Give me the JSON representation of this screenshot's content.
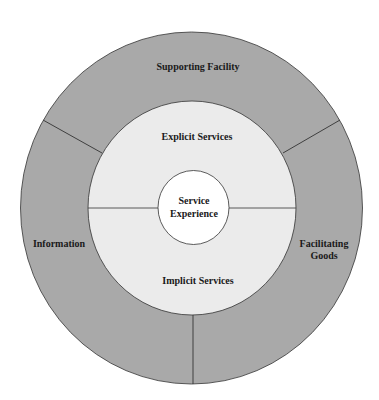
{
  "diagram": {
    "title": "",
    "outer_ring": {
      "segments": [
        {
          "id": "supporting-facility",
          "lines": [
            "Supporting Facility"
          ]
        },
        {
          "id": "information",
          "lines": [
            "Information"
          ]
        },
        {
          "id": "facilitating-goods",
          "lines": [
            "Facilitating",
            "Goods"
          ]
        }
      ]
    },
    "middle_ring": {
      "segments": [
        {
          "id": "explicit-services",
          "lines": [
            "Explicit Services"
          ]
        },
        {
          "id": "implicit-services",
          "lines": [
            "Implicit Services"
          ]
        }
      ]
    },
    "core": {
      "id": "service-experience",
      "lines": [
        "Service",
        "Experience"
      ]
    }
  },
  "colors": {
    "outer_ring": "#a9a9a9",
    "middle_ring": "#ebebeb",
    "core": "#ffffff",
    "stroke": "#333333",
    "text": "#1a1a1a"
  }
}
